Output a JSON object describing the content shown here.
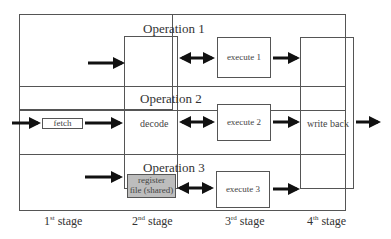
{
  "operations": [
    {
      "title": "Operation 1",
      "execute": "execute 1"
    },
    {
      "title": "Operation 2",
      "execute": "execute 2"
    },
    {
      "title": "Operation 3",
      "execute": "execute 3"
    }
  ],
  "units": {
    "fetch": "fetch",
    "decode": "decode",
    "register_file_line1": "register",
    "register_file_line2": "file (shared)",
    "write_back": "write back"
  },
  "stages": [
    {
      "num": "1",
      "suffix": "st",
      "word": "stage"
    },
    {
      "num": "2",
      "suffix": "nd",
      "word": "stage"
    },
    {
      "num": "3",
      "suffix": "rd",
      "word": "stage"
    },
    {
      "num": "4",
      "suffix": "th",
      "word": "stage"
    }
  ],
  "colors": {
    "line": "#555555",
    "arrow": "#111111",
    "register_fill": "#bdbdbd"
  }
}
